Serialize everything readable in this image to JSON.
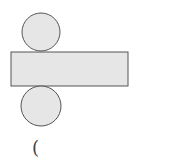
{
  "diagram": {
    "type": "cylinder-net",
    "colors": {
      "fill": "#e6e6e6",
      "stroke": "#555555"
    },
    "top_circle": {
      "cx": 41,
      "cy": 32,
      "r": 19
    },
    "rectangle": {
      "x": 11,
      "y": 52,
      "width": 117,
      "height": 34
    },
    "bottom_circle": {
      "cx": 41,
      "cy": 106,
      "r": 20
    },
    "caption": "("
  }
}
